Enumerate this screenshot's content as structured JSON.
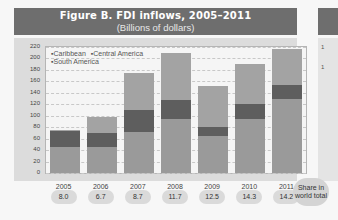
{
  "header": {
    "title": "Figure B. FDI inflows, 2005–2011",
    "subtitle": "(Billions of dollars)"
  },
  "legend": {
    "items": [
      "▪Caribbean",
      "▪Central America",
      "▪South America"
    ]
  },
  "y_ticks": [
    "0",
    "20",
    "40",
    "60",
    "80",
    "100",
    "120",
    "140",
    "160",
    "180",
    "200",
    "220"
  ],
  "share_label": "Share in world total",
  "colors": {
    "header_bg": "#6e6e6e",
    "south_america": "#9a9a9a",
    "central_america": "#5e5e5e",
    "caribbean": "#a3a3a3"
  },
  "right_panel_ticks": [
    "1",
    "1"
  ],
  "chart_data": {
    "type": "bar",
    "stacked": true,
    "title": "Figure B. FDI inflows, 2005–2011",
    "subtitle": "(Billions of dollars)",
    "xlabel": "",
    "ylabel": "Billions of dollars",
    "ylim": [
      0,
      220
    ],
    "y_ticks": [
      0,
      20,
      40,
      60,
      80,
      100,
      120,
      140,
      160,
      180,
      200,
      220
    ],
    "grid": true,
    "legend_position": "top-left inside plot",
    "categories": [
      "2005",
      "2006",
      "2007",
      "2008",
      "2009",
      "2010",
      "2011"
    ],
    "series": [
      {
        "name": "South America",
        "values": [
          45,
          45,
          72,
          95,
          65,
          95,
          129
        ]
      },
      {
        "name": "Central America",
        "values": [
          28,
          25,
          38,
          33,
          15,
          25,
          24
        ]
      },
      {
        "name": "Caribbean",
        "values": [
          3,
          27,
          64,
          82,
          72,
          70,
          64
        ]
      }
    ],
    "totals": [
      76,
      97,
      174,
      210,
      152,
      190,
      217
    ],
    "annotations": {
      "label": "Share in world total",
      "share_in_world_total": [
        "8.0",
        "6.7",
        "8.7",
        "11.7",
        "12.5",
        "14.3",
        "14.2"
      ]
    }
  }
}
